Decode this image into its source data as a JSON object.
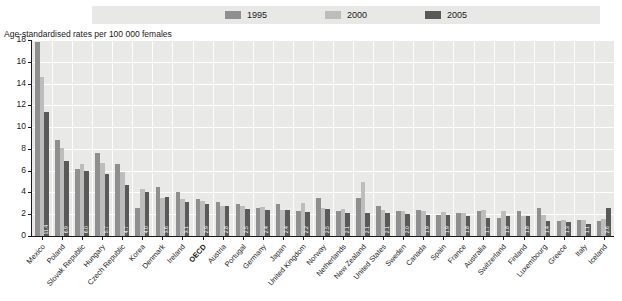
{
  "legend": {
    "items": [
      {
        "label": "1995",
        "color": "#8f8f8f"
      },
      {
        "label": "2000",
        "color": "#bdbdbd"
      },
      {
        "label": "2005",
        "color": "#595959"
      }
    ]
  },
  "axis_title": "Age-standardised rates per 100 000 females",
  "y_ticks": [
    "0",
    "2",
    "4",
    "6",
    "8",
    "10",
    "12",
    "14",
    "16",
    "18"
  ],
  "chart_data": {
    "type": "bar",
    "title": "Age-standardised rates per 100 000 females",
    "xlabel": "",
    "ylabel": "Age-standardised rates per 100 000 females",
    "ylim": [
      0,
      18
    ],
    "ytick_step": 2,
    "grid": true,
    "legend_position": "top",
    "value_labels_on_series": "2005",
    "categories": [
      "Mexico",
      "Poland",
      "Slovak Republic",
      "Hungary",
      "Czech Republic",
      "Korea",
      "Denmark",
      "Ireland",
      "OECD",
      "Austria",
      "Portugal",
      "Germany",
      "Japan",
      "United Kingdom",
      "Norway",
      "Netherlands",
      "New Zealand",
      "United States",
      "Sweden",
      "Canada",
      "Spain",
      "France",
      "Australia",
      "Switzerland",
      "Finland",
      "Luxembourg",
      "Greece",
      "Italy",
      "Iceland"
    ],
    "highlight_category": "OECD",
    "series": [
      {
        "name": "1995",
        "color": "#8f8f8f",
        "values": [
          17.8,
          8.8,
          6.2,
          7.6,
          6.6,
          2.6,
          4.5,
          4.0,
          3.4,
          3.1,
          2.9,
          2.6,
          2.9,
          2.3,
          3.5,
          2.3,
          3.5,
          2.8,
          2.3,
          2.4,
          1.9,
          2.1,
          2.3,
          1.7,
          2.3,
          2.6,
          1.4,
          1.5,
          1.4
        ]
      },
      {
        "name": "2000",
        "color": "#bdbdbd",
        "values": [
          14.6,
          8.1,
          6.6,
          6.7,
          5.9,
          4.3,
          3.5,
          3.4,
          3.2,
          2.8,
          2.8,
          2.7,
          2.4,
          3.0,
          2.6,
          2.5,
          5.0,
          2.4,
          2.3,
          2.3,
          2.2,
          2.1,
          2.4,
          2.3,
          1.8,
          1.9,
          1.5,
          1.5,
          1.6
        ]
      },
      {
        "name": "2005",
        "color": "#595959",
        "values": [
          11.4,
          6.9,
          6.0,
          5.7,
          4.7,
          4.0,
          3.6,
          3.1,
          2.9,
          2.8,
          2.5,
          2.4,
          2.4,
          2.2,
          2.5,
          2.1,
          2.1,
          2.1,
          2.0,
          1.9,
          1.9,
          1.8,
          1.7,
          1.8,
          1.8,
          1.4,
          1.3,
          1.1,
          2.6
        ]
      }
    ],
    "value_labels_2005": [
      "11.4",
      "6.9",
      "6.0",
      "5.7",
      "4.7",
      "4.0",
      "3.6",
      "3.1",
      "2.9",
      "2.8",
      "2.5",
      "2.4",
      "2.4",
      "2.2",
      "2.5",
      "2.1",
      "2.1",
      "2.1",
      "2.0",
      "1.9",
      "1.9",
      "1.8",
      "1.7",
      "1.8",
      "1.8",
      "1.4",
      "1.3",
      "1.1",
      "2.6"
    ]
  }
}
